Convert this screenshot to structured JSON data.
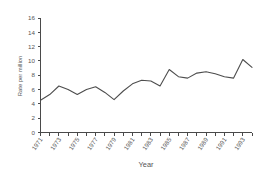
{
  "chart_data": {
    "type": "line",
    "title": "",
    "xlabel": "Year",
    "ylabel": "Rate per million",
    "xlim": [
      1971,
      1994
    ],
    "ylim": [
      0,
      16
    ],
    "ytick_step": 2,
    "grid": false,
    "legend": "none",
    "line_color": "#4d4d4d",
    "axis_color": "#4a4a4a",
    "text_color": "#555555",
    "background": "#ffffff",
    "yticks": [
      0,
      2,
      4,
      6,
      8,
      10,
      12,
      14,
      16
    ],
    "ytick_labels": [
      "0",
      "2",
      "4",
      "6",
      "8",
      "10",
      "12",
      "14",
      "16"
    ],
    "xticks": [
      1971,
      1972,
      1973,
      1974,
      1975,
      1976,
      1977,
      1978,
      1979,
      1980,
      1981,
      1982,
      1983,
      1984,
      1985,
      1986,
      1987,
      1988,
      1989,
      1990,
      1991,
      1992,
      1993,
      1994
    ],
    "xtick_labels_shown": [
      "1971",
      "1973",
      "1975",
      "1977",
      "1979",
      "1981",
      "1983",
      "1985",
      "1987",
      "1989",
      "1991",
      "1993"
    ],
    "x": [
      1971,
      1972,
      1973,
      1974,
      1975,
      1976,
      1977,
      1978,
      1979,
      1980,
      1981,
      1982,
      1983,
      1984,
      1985,
      1986,
      1987,
      1988,
      1989,
      1990,
      1991,
      1992,
      1993,
      1994
    ],
    "values": [
      4.5,
      5.3,
      6.5,
      6.0,
      5.3,
      6.0,
      6.4,
      5.6,
      4.6,
      5.8,
      6.8,
      7.3,
      7.2,
      6.5,
      8.8,
      7.8,
      7.6,
      8.3,
      8.5,
      8.2,
      7.8,
      7.6,
      10.2,
      9.1
    ]
  }
}
